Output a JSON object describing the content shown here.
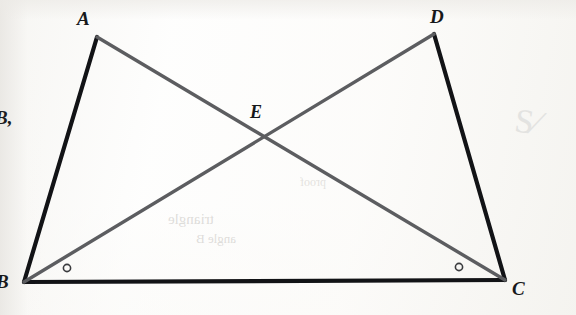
{
  "figure": {
    "caption_note": "Scanned geometry worksheet figure",
    "background_color": "#fdfdfc",
    "margin_annotation": "B,",
    "faint_pencil_mark": "S⁄",
    "bleed_through": {
      "line_1": "triangle",
      "line_2": "angle B",
      "line_3": "proof"
    },
    "points": [
      {
        "id": "A",
        "label": "A",
        "x": 97,
        "y": 37,
        "label_x": 77,
        "label_y": 9
      },
      {
        "id": "D",
        "label": "D",
        "x": 434,
        "y": 34,
        "label_x": 430,
        "label_y": 7
      },
      {
        "id": "E",
        "label": "E",
        "x": 265,
        "y": 137,
        "label_x": 250,
        "label_y": 103
      },
      {
        "id": "B",
        "label": "B",
        "x": 24,
        "y": 282,
        "label_x": -4,
        "label_y": 272
      },
      {
        "id": "C",
        "label": "C",
        "x": 505,
        "y": 280,
        "label_x": 512,
        "label_y": 279
      }
    ],
    "segments": [
      {
        "id": "AB",
        "from": "A",
        "to": "B",
        "color": "#121316",
        "width": 4.2,
        "style": "solid",
        "role": "triangle-side"
      },
      {
        "id": "BC",
        "from": "B",
        "to": "C",
        "color": "#121316",
        "width": 4.2,
        "style": "solid",
        "role": "shared-base"
      },
      {
        "id": "DC",
        "from": "D",
        "to": "C",
        "color": "#121316",
        "width": 4.2,
        "style": "solid",
        "role": "triangle-side"
      },
      {
        "id": "AC",
        "from": "A",
        "to": "C",
        "color": "#5c5d60",
        "width": 3.4,
        "style": "solid",
        "role": "diagonal"
      },
      {
        "id": "BD",
        "from": "B",
        "to": "D",
        "color": "#5c5d60",
        "width": 3.4,
        "style": "solid",
        "role": "diagonal"
      }
    ],
    "angle_marks": [
      {
        "id": "angle-B",
        "at": "B",
        "x": 67,
        "y": 268,
        "radius": 3.6,
        "color": "#3a3b3e",
        "symbol": "circle"
      },
      {
        "id": "angle-C",
        "at": "C",
        "x": 459,
        "y": 267,
        "radius": 3.6,
        "color": "#3a3b3e",
        "symbol": "circle"
      }
    ],
    "colors": {
      "ink_black": "#121316",
      "ink_gray": "#5c5d60",
      "label_ink": "#17181a",
      "pencil": "#e3e3e1",
      "paper": "#fdfdfc"
    }
  }
}
